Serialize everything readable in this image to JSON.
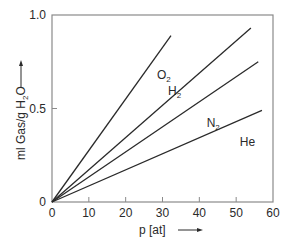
{
  "chart_data": {
    "type": "line",
    "title": "",
    "xlabel": "p [at]",
    "ylabel": "ml Gas/g H2O",
    "ylabel_parts": {
      "pre": "ml Gas/g H",
      "sub": "2",
      "post": "O"
    },
    "xlim": [
      0,
      60
    ],
    "ylim": [
      0,
      1.0
    ],
    "x_ticks": [
      0,
      10,
      20,
      30,
      40,
      50,
      60
    ],
    "x_tick_labels": [
      "0",
      "10",
      "20",
      "30",
      "40",
      "50",
      "60"
    ],
    "y_ticks": [
      0,
      0.5,
      1.0
    ],
    "y_tick_labels": [
      "0",
      "0.5",
      "1.0"
    ],
    "grid": false,
    "legend": "inline labels",
    "series": [
      {
        "name": "O2",
        "label_main": "O",
        "label_sub": "2",
        "x": [
          0,
          32.3
        ],
        "y": [
          0,
          0.89
        ],
        "label_pos": [
          28.5,
          0.66
        ]
      },
      {
        "name": "H2",
        "label_main": "H",
        "label_sub": "2",
        "x": [
          0,
          54.0
        ],
        "y": [
          0,
          0.93
        ],
        "label_pos": [
          31.5,
          0.57
        ]
      },
      {
        "name": "N2",
        "label_main": "N",
        "label_sub": "2",
        "x": [
          0,
          56.0
        ],
        "y": [
          0,
          0.75
        ],
        "label_pos": [
          42.0,
          0.4
        ]
      },
      {
        "name": "He",
        "label_main": "He",
        "label_sub": "",
        "x": [
          0,
          57.0
        ],
        "y": [
          0,
          0.49
        ],
        "label_pos": [
          51.0,
          0.3
        ]
      }
    ]
  }
}
